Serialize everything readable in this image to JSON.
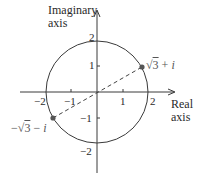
{
  "figure": {
    "y_axis_title_line1": "Imaginary",
    "y_axis_title_line2": "axis",
    "x_axis_title_line1": "Real",
    "x_axis_title_line2": "axis",
    "x_ticks": [
      {
        "value": -2,
        "label": "−2"
      },
      {
        "value": -1,
        "label": "−1"
      },
      {
        "value": 1,
        "label": "1"
      },
      {
        "value": 2,
        "label": "2"
      }
    ],
    "y_ticks": [
      {
        "value": 2,
        "label": "2"
      },
      {
        "value": 1,
        "label": "1"
      },
      {
        "value": -1,
        "label": "−1"
      },
      {
        "value": -2,
        "label": "−2"
      }
    ],
    "points": [
      {
        "name": "sqrt3-plus-i",
        "label_prefix": "",
        "radicand": "3",
        "label_suffix": " + ",
        "imag": "i",
        "re": 1.732,
        "im": 1
      },
      {
        "name": "neg-sqrt3-minus-i",
        "label_prefix": "−",
        "radicand": "3",
        "label_suffix": " − ",
        "imag": "i",
        "re": -1.732,
        "im": -1
      }
    ],
    "circle": {
      "center": [
        0,
        0
      ],
      "radius": 2
    },
    "colors": {
      "lines": "#3a3a3a",
      "points": "#555555",
      "dashed": "#444444"
    }
  }
}
